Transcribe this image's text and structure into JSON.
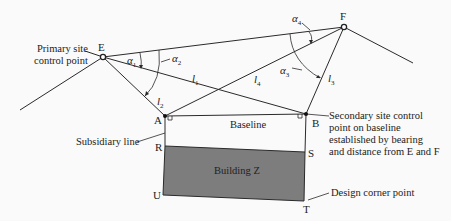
{
  "diagram": {
    "points": {
      "E": "E",
      "F": "F",
      "A": "A",
      "B": "B",
      "R": "R",
      "S": "S",
      "U": "U",
      "T": "T"
    },
    "angles": {
      "a1": {
        "sym": "α",
        "sub": "1"
      },
      "a2": {
        "sym": "α",
        "sub": "2"
      },
      "a3": {
        "sym": "α",
        "sub": "3"
      },
      "a4": {
        "sym": "α",
        "sub": "4"
      }
    },
    "distances": {
      "l1": {
        "sym": "l",
        "sub": "1"
      },
      "l2": {
        "sym": "l",
        "sub": "2"
      },
      "l3": {
        "sym": "l",
        "sub": "3"
      },
      "l4": {
        "sym": "l",
        "sub": "4"
      }
    },
    "labels": {
      "primary_line1": "Primary site",
      "primary_line2": "control point",
      "baseline": "Baseline",
      "building": "Building Z",
      "subsidiary": "Subsidiary line",
      "secondary_line1": "Secondary site control",
      "secondary_line2": "point on baseline",
      "secondary_line3": "established by bearing",
      "secondary_line4": "and distance from E and F",
      "design_corner": "Design corner point"
    },
    "colors": {
      "line": "#2a2a2a",
      "building_fill": "#7d7d7d",
      "background": "#fafafa"
    }
  }
}
